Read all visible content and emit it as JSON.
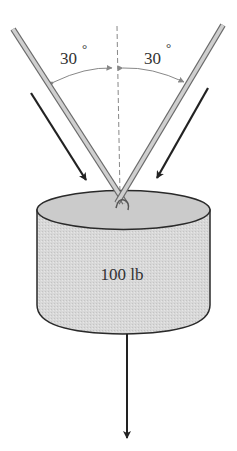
{
  "diagram": {
    "angle_left": {
      "value": "30",
      "unit": "°"
    },
    "angle_right": {
      "value": "30",
      "unit": "°"
    },
    "weight_label": "100 lb",
    "colors": {
      "rod_fill": "#c8c8c8",
      "rod_edge": "#6a6a6a",
      "cylinder_fill": "#d9d9d9",
      "cylinder_top": "#cfcfcf",
      "outline": "#2a2a2a",
      "arrow": "#222222",
      "dimension": "#888888"
    }
  }
}
